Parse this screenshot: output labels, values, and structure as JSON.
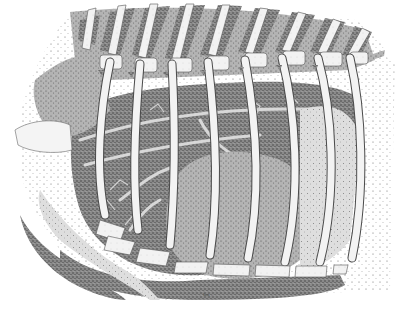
{
  "figure": {
    "style": "black-and-white stipple drawing",
    "signature": "Tom ...",
    "colors": {
      "background": "#ffffff",
      "ink_dark": "#3a3a3a",
      "ink_mid": "#7a7a7a",
      "ink_light": "#bdbdbd",
      "bone": "#f1f1f1"
    },
    "rib_count": 10
  }
}
